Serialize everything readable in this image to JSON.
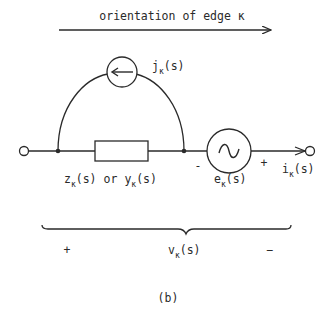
{
  "figure": {
    "caption": "(b)",
    "orientation": {
      "label": "orientation of edge κ"
    },
    "current_source": {
      "symbol": "j",
      "subscript": "κ",
      "arg": "(s)",
      "icon": "arrow-left-icon"
    },
    "impedance": {
      "z_symbol": "z",
      "y_symbol": "y",
      "subscript": "κ",
      "arg": "(s)",
      "connector": "or"
    },
    "voltage_source": {
      "symbol": "e",
      "subscript": "κ",
      "arg": "(s)",
      "minus": "-",
      "plus": "+",
      "icon": "sine-wave-icon"
    },
    "branch_current": {
      "symbol": "i",
      "subscript": "κ",
      "arg": "(s)"
    },
    "branch_voltage": {
      "symbol": "v",
      "subscript": "κ",
      "arg": "(s)",
      "plus": "+",
      "minus": "−"
    },
    "colors": {
      "ink": "#2a2a2a",
      "background": "#ffffff"
    }
  }
}
